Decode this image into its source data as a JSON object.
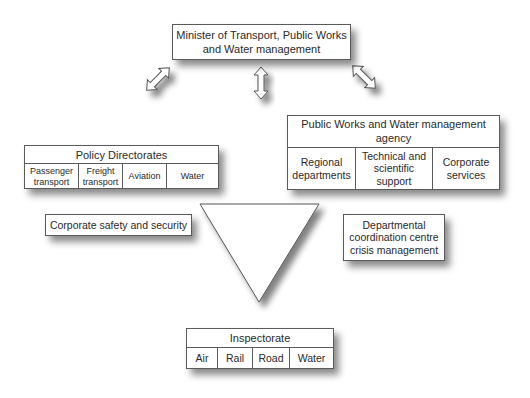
{
  "minister": {
    "line1": "Minister of Transport, Public Works",
    "line2": "and Water management"
  },
  "arrows": [
    {
      "name": "left-double-arrow",
      "direction": "diagonal-up-right"
    },
    {
      "name": "center-double-arrow",
      "direction": "vertical"
    },
    {
      "name": "right-double-arrow",
      "direction": "diagonal-up-left"
    }
  ],
  "policy": {
    "title": "Policy Directorates",
    "units": [
      {
        "line1": "Passenger",
        "line2": "transport"
      },
      {
        "line1": "Freight",
        "line2": "transport"
      },
      {
        "line1": "Aviation",
        "line2": ""
      },
      {
        "line1": "Water",
        "line2": ""
      }
    ]
  },
  "agency": {
    "title_line1": "Public Works and Water management",
    "title_line2": "agency",
    "units": [
      {
        "line1": "Regional",
        "line2": "departments",
        "line3": ""
      },
      {
        "line1": "Technical and",
        "line2": "scientific",
        "line3": "support"
      },
      {
        "line1": "Corporate",
        "line2": "services",
        "line3": ""
      }
    ]
  },
  "safety": {
    "label": "Corporate safety and security"
  },
  "crisis": {
    "line1": "Departmental",
    "line2": "coordination centre",
    "line3": "crisis management"
  },
  "inspectorate": {
    "title": "Inspectorate",
    "units": [
      "Air",
      "Rail",
      "Road",
      "Water"
    ]
  }
}
